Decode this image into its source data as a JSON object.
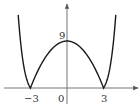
{
  "chart_data": {
    "type": "line",
    "title": "",
    "function": "y = |9 - x^2|",
    "xlabel": "",
    "ylabel": "",
    "grid": false,
    "legend": null,
    "x_ticks": [
      {
        "value": -3,
        "label": "−3"
      },
      {
        "value": 0,
        "label": "0"
      },
      {
        "value": 3,
        "label": "3"
      }
    ],
    "y_ticks": [
      {
        "value": 9,
        "label": "9"
      }
    ],
    "key_points": [
      {
        "x": -3,
        "y": 0
      },
      {
        "x": 0,
        "y": 9
      },
      {
        "x": 3,
        "y": 0
      }
    ],
    "xlim": [
      -5.2,
      5.8
    ],
    "ylim": [
      -3,
      16
    ],
    "colors": {
      "curve": "#1a1a1a",
      "axis": "#555555"
    }
  }
}
